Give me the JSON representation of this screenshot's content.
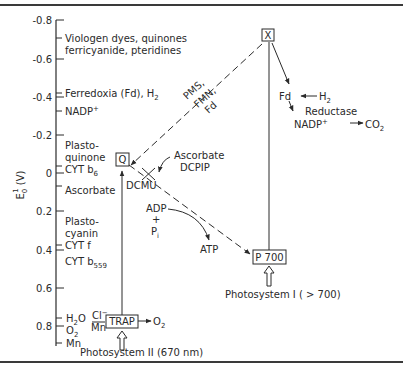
{
  "diagram": {
    "axis": {
      "label": "E",
      "label_sub": "0",
      "label_sup": "1",
      "label_unit": "(V)",
      "ticks": [
        "-0.8",
        "-0.6",
        "-0.4",
        "-0.2",
        "0",
        "0.2",
        "0.4",
        "0.6",
        "0.8"
      ]
    },
    "axis_annotations": {
      "viologen_1": "Viologen dyes, quinones",
      "viologen_2": "ferricyanide, pteridines",
      "ferredoxia": "Ferredoxia (Fd), H",
      "ferredoxia_sub": "2",
      "nadp": "NADP",
      "nadp_sup": "+",
      "plasto_1": "Plasto-",
      "plasto_2": "quinone",
      "cyt_b6": "CYT b",
      "cyt_b6_sub": "6",
      "ascorbate": "Ascorbate",
      "plastocyanin_1": "Plasto-",
      "plastocyanin_2": "cyanin",
      "cyt_f": "CYT f",
      "cyt_b559": "CYT b",
      "cyt_b559_sub": "559",
      "h2o": "H",
      "h2o_sub": "2",
      "h2o_o": "O",
      "o2": "O",
      "o2_sub": "2",
      "mn": "Mn"
    },
    "nodes": {
      "x_box": "X",
      "q_box": "Q",
      "p700_box": "P 700",
      "trap_box": "TRAP"
    },
    "labels": {
      "pms": "PMS,",
      "fmn": "FMN,",
      "fd_diag": "Fd",
      "fd": "Fd",
      "h2": "H",
      "h2_sub": "2",
      "reductase": "Reductase",
      "nadp_right": "NADP",
      "nadp_right_sup": "+",
      "co2": "CO",
      "co2_sub": "2",
      "ascorbate_dcpip_1": "Ascorbate",
      "ascorbate_dcpip_2": "DCPIP",
      "dcmu": "DCMU",
      "adp": "ADP",
      "plus": "+",
      "pi": "P",
      "pi_sub": "i",
      "atp": "ATP",
      "cl": "Cl",
      "cl_sup": "−",
      "mn_frac": "Mn",
      "o2_out": "O",
      "o2_out_sub": "2",
      "ps1": "Photosystem I ( > 700)",
      "ps2": "Photosystem II (670 nm)"
    },
    "colors": {
      "ink": "#2a2a2a",
      "rule": "#3a3a3a",
      "background": "#ffffff"
    }
  }
}
